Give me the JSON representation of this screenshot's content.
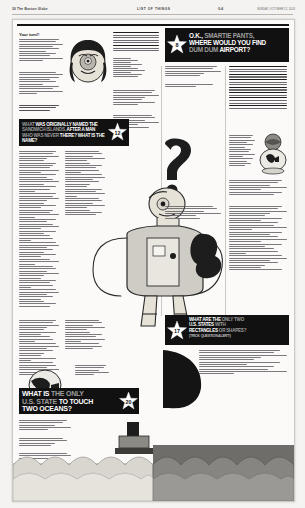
{
  "page": {
    "publication_left": "30  The Boston Globe",
    "section_center": "LIST OF THINGS",
    "page_number": "G 4",
    "dateline_right": "SUNDAY, OCTOBER 12, 2014",
    "background_color": "#f4f3f1",
    "sheet_color": "#fbfaf8",
    "ink_color": "#111111"
  },
  "headlines": [
    {
      "id": "hl-smartie-pants",
      "star_number": "8",
      "line1_lead": "O.K.,",
      "line1_rest": "SMARTIE PANTS,",
      "line2": "WHERE WOULD YOU FIND",
      "line3_lead": "DUM DUM",
      "line3_rest": "AIRPORT?",
      "full_text": "O.K., SMARTIE PANTS, WHERE WOULD YOU FIND DUM DUM AIRPORT?"
    },
    {
      "id": "hl-named-after-a-man",
      "star_number": "12",
      "line1_lead": "WHAT",
      "line1_rest": "WAS ORIGINALLY NAMED THE",
      "line2_lead": "SANDWICH ISLANDS,",
      "line2_rest": "AFTER A MAN",
      "line3_lead": "WHO WAS NEVER",
      "line3_rest": "THERE?",
      "line4": "WHAT IS THE NAME?",
      "full_text": "WHAT WAS ORIGINALLY NAMED THE SANDWICH ISLANDS, AFTER A MAN WHO WAS NEVER THERE? WHAT IS THE NAME?"
    },
    {
      "id": "hl-two-oceans",
      "star_number": "20",
      "line1_lead": "WHAT IS",
      "line1_rest": "THE ONLY",
      "line2_lead": "U.S. STATE",
      "line2_rest": "TO TOUCH",
      "line3": "TWO OCEANS?",
      "full_text": "WHAT IS THE ONLY U.S. STATE TO TOUCH TWO OCEANS?"
    },
    {
      "id": "hl-rectangles",
      "star_number": "17",
      "line1_lead": "WHAT ARE THE",
      "line1_rest": "ONLY TWO",
      "line2_lead": "U.S. STATES",
      "line2_rest": "WITH",
      "line3_lead": "RECTANGLES",
      "line3_rest": "OR SHAPES?",
      "line4_lead": "(TRICK",
      "line4_rest": "QUESTION ALERT!)",
      "full_text": "WHAT ARE THE ONLY TWO U.S. STATES WITH RECTANGLES OR SHAPES? (TRICK QUESTION ALERT!)"
    }
  ],
  "columns": {
    "lead_in_label": "Your turn!!",
    "question_list_label": "1.",
    "answers_label": "Answers"
  },
  "illustration": {
    "main_figure": "standing-figure-with-question-mark-head",
    "head_top_left": "face-portrait",
    "globe": "globe-illustration",
    "ocean": "ocean-waves"
  }
}
